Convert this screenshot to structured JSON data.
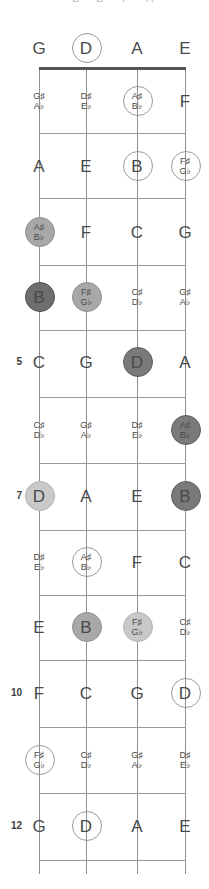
{
  "diagram": {
    "instrument": "4-string bass",
    "orientation": "vertical",
    "string_count": 4,
    "fret_count": 12
  },
  "strings": [
    {
      "name": "G-string",
      "open_note": "G",
      "x": 39
    },
    {
      "name": "D-string",
      "open_note": "D",
      "x": 86
    },
    {
      "name": "A-string",
      "open_note": "A",
      "x": 137
    },
    {
      "name": "E-string",
      "open_note": "E",
      "x": 185
    }
  ],
  "fret_lines": [
    68,
    133,
    198,
    265,
    330,
    397,
    463,
    530,
    595,
    660,
    727,
    793,
    860
  ],
  "fret_numbers": [
    {
      "label": "5",
      "y": 362
    },
    {
      "label": "7",
      "y": 496
    },
    {
      "label": "10",
      "y": 693
    },
    {
      "label": "12",
      "y": 826
    }
  ],
  "clipped_top_glyphs": [
    {
      "text": "B",
      "x": 72
    },
    {
      "text": "B",
      "x": 96
    },
    {
      "text": "F",
      "x": 122
    },
    {
      "text": "A",
      "x": 146
    }
  ],
  "rows": [
    {
      "fret": 0,
      "y": 48,
      "notes": [
        {
          "string": 0,
          "natural": "G",
          "sharp": "",
          "flat": "",
          "marker": "none"
        },
        {
          "string": 1,
          "natural": "D",
          "sharp": "",
          "flat": "",
          "marker": "open"
        },
        {
          "string": 2,
          "natural": "A",
          "sharp": "",
          "flat": "",
          "marker": "none"
        },
        {
          "string": 3,
          "natural": "E",
          "sharp": "",
          "flat": "",
          "marker": "none"
        }
      ]
    },
    {
      "fret": 1,
      "y": 101,
      "notes": [
        {
          "string": 0,
          "natural": "",
          "sharp": "G♯",
          "flat": "A♭",
          "marker": "none"
        },
        {
          "string": 1,
          "natural": "",
          "sharp": "D♯",
          "flat": "E♭",
          "marker": "none"
        },
        {
          "string": 2,
          "natural": "",
          "sharp": "A♯",
          "flat": "B♭",
          "marker": "open"
        },
        {
          "string": 3,
          "natural": "F",
          "sharp": "",
          "flat": "",
          "marker": "none"
        }
      ]
    },
    {
      "fret": 2,
      "y": 166,
      "notes": [
        {
          "string": 0,
          "natural": "A",
          "sharp": "",
          "flat": "",
          "marker": "none"
        },
        {
          "string": 1,
          "natural": "E",
          "sharp": "",
          "flat": "",
          "marker": "none"
        },
        {
          "string": 2,
          "natural": "B",
          "sharp": "",
          "flat": "",
          "marker": "open"
        },
        {
          "string": 3,
          "natural": "",
          "sharp": "F♯",
          "flat": "G♭",
          "marker": "open"
        }
      ]
    },
    {
      "fret": 3,
      "y": 232,
      "notes": [
        {
          "string": 0,
          "natural": "",
          "sharp": "A♯",
          "flat": "B♭",
          "marker": "mid"
        },
        {
          "string": 1,
          "natural": "F",
          "sharp": "",
          "flat": "",
          "marker": "none"
        },
        {
          "string": 2,
          "natural": "C",
          "sharp": "",
          "flat": "",
          "marker": "none"
        },
        {
          "string": 3,
          "natural": "G",
          "sharp": "",
          "flat": "",
          "marker": "none"
        }
      ]
    },
    {
      "fret": 4,
      "y": 297,
      "notes": [
        {
          "string": 0,
          "natural": "B",
          "sharp": "",
          "flat": "",
          "marker": "darker"
        },
        {
          "string": 1,
          "natural": "",
          "sharp": "F♯",
          "flat": "G♭",
          "marker": "mid"
        },
        {
          "string": 2,
          "natural": "",
          "sharp": "C♯",
          "flat": "D♭",
          "marker": "none"
        },
        {
          "string": 3,
          "natural": "",
          "sharp": "G♯",
          "flat": "A♭",
          "marker": "none"
        }
      ]
    },
    {
      "fret": 5,
      "y": 362,
      "notes": [
        {
          "string": 0,
          "natural": "C",
          "sharp": "",
          "flat": "",
          "marker": "none"
        },
        {
          "string": 1,
          "natural": "G",
          "sharp": "",
          "flat": "",
          "marker": "none"
        },
        {
          "string": 2,
          "natural": "D",
          "sharp": "",
          "flat": "",
          "marker": "dark"
        },
        {
          "string": 3,
          "natural": "A",
          "sharp": "",
          "flat": "",
          "marker": "none"
        }
      ]
    },
    {
      "fret": 6,
      "y": 430,
      "notes": [
        {
          "string": 0,
          "natural": "",
          "sharp": "C♯",
          "flat": "D♭",
          "marker": "none"
        },
        {
          "string": 1,
          "natural": "",
          "sharp": "G♯",
          "flat": "A♭",
          "marker": "none"
        },
        {
          "string": 2,
          "natural": "",
          "sharp": "D♯",
          "flat": "E♭",
          "marker": "none"
        },
        {
          "string": 3,
          "natural": "",
          "sharp": "A♯",
          "flat": "B♭",
          "marker": "dark"
        }
      ]
    },
    {
      "fret": 7,
      "y": 496,
      "notes": [
        {
          "string": 0,
          "natural": "D",
          "sharp": "",
          "flat": "",
          "marker": "light"
        },
        {
          "string": 1,
          "natural": "A",
          "sharp": "",
          "flat": "",
          "marker": "none"
        },
        {
          "string": 2,
          "natural": "E",
          "sharp": "",
          "flat": "",
          "marker": "none"
        },
        {
          "string": 3,
          "natural": "B",
          "sharp": "",
          "flat": "",
          "marker": "dark"
        }
      ]
    },
    {
      "fret": 8,
      "y": 562,
      "notes": [
        {
          "string": 0,
          "natural": "",
          "sharp": "D♯",
          "flat": "E♭",
          "marker": "none"
        },
        {
          "string": 1,
          "natural": "",
          "sharp": "A♯",
          "flat": "B♭",
          "marker": "open"
        },
        {
          "string": 2,
          "natural": "F",
          "sharp": "",
          "flat": "",
          "marker": "none"
        },
        {
          "string": 3,
          "natural": "C",
          "sharp": "",
          "flat": "",
          "marker": "none"
        }
      ]
    },
    {
      "fret": 9,
      "y": 627,
      "notes": [
        {
          "string": 0,
          "natural": "E",
          "sharp": "",
          "flat": "",
          "marker": "none"
        },
        {
          "string": 1,
          "natural": "B",
          "sharp": "",
          "flat": "",
          "marker": "mid"
        },
        {
          "string": 2,
          "natural": "",
          "sharp": "F♯",
          "flat": "G♭",
          "marker": "light"
        },
        {
          "string": 3,
          "natural": "",
          "sharp": "C♯",
          "flat": "D♭",
          "marker": "none"
        }
      ]
    },
    {
      "fret": 10,
      "y": 693,
      "notes": [
        {
          "string": 0,
          "natural": "F",
          "sharp": "",
          "flat": "",
          "marker": "none"
        },
        {
          "string": 1,
          "natural": "C",
          "sharp": "",
          "flat": "",
          "marker": "none"
        },
        {
          "string": 2,
          "natural": "G",
          "sharp": "",
          "flat": "",
          "marker": "none"
        },
        {
          "string": 3,
          "natural": "D",
          "sharp": "",
          "flat": "",
          "marker": "open"
        }
      ]
    },
    {
      "fret": 11,
      "y": 760,
      "notes": [
        {
          "string": 0,
          "natural": "",
          "sharp": "F♯",
          "flat": "G♭",
          "marker": "open"
        },
        {
          "string": 1,
          "natural": "",
          "sharp": "C♯",
          "flat": "D♭",
          "marker": "none"
        },
        {
          "string": 2,
          "natural": "",
          "sharp": "G♯",
          "flat": "A♭",
          "marker": "none"
        },
        {
          "string": 3,
          "natural": "",
          "sharp": "D♯",
          "flat": "E♭",
          "marker": "none"
        }
      ]
    },
    {
      "fret": 12,
      "y": 826,
      "notes": [
        {
          "string": 0,
          "natural": "G",
          "sharp": "",
          "flat": "",
          "marker": "none"
        },
        {
          "string": 1,
          "natural": "D",
          "sharp": "",
          "flat": "",
          "marker": "open"
        },
        {
          "string": 2,
          "natural": "A",
          "sharp": "",
          "flat": "",
          "marker": "none"
        },
        {
          "string": 3,
          "natural": "E",
          "sharp": "",
          "flat": "",
          "marker": "none"
        }
      ]
    }
  ],
  "marker_styles": {
    "open": {
      "fill": "transparent",
      "stroke": "#9a9a9a",
      "size": 30
    },
    "light": {
      "fill": "#c9c9c9",
      "stroke": "#b4b4b4",
      "size": 30
    },
    "mid": {
      "fill": "#a8a8a8",
      "stroke": "#8e8e8e",
      "size": 30
    },
    "dark": {
      "fill": "#7a7a7a",
      "stroke": "#5f5f5f",
      "size": 30
    },
    "darker": {
      "fill": "#6e6e6e",
      "stroke": "#4f4f4f",
      "size": 30
    }
  },
  "colors": {
    "background": "#ffffff",
    "string_line": "#8f8f8f",
    "fret_line": "#9b9b9b",
    "nut": "#555555",
    "text": "#4a4a4a",
    "fret_number": "#3d3d3d"
  }
}
